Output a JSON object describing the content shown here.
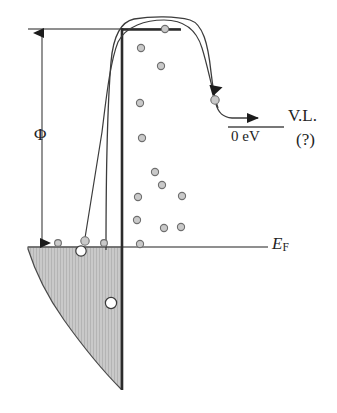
{
  "figure": {
    "type": "energy-level-diagram",
    "title_text": "",
    "colors": {
      "line": "#2b2b2b",
      "thin_line": "#555555",
      "band_fill": "#c8c8c8",
      "band_hatch": "#b0b0b0",
      "band_edge": "#4a4a4a",
      "electron_fill": "#c9c9c9",
      "electron_stroke": "#6e6e6e",
      "hole_fill": "#ffffff",
      "hole_stroke": "#3a3a3a",
      "background": "#ffffff"
    },
    "labels": {
      "work_function": "Φ",
      "fermi_level": "E",
      "fermi_level_sub": "F",
      "vacuum_energy": "0 eV",
      "vacuum_level": "V.L.",
      "vacuum_level_query": "(?)"
    },
    "levels": {
      "vacuum_line_y": 29,
      "fermi_line_y": 247,
      "zero_ev_line_y": 127,
      "surface_x": 122
    },
    "electrons": [
      {
        "cx": 165,
        "cy": 29,
        "r": 3.6
      },
      {
        "cx": 141,
        "cy": 48,
        "r": 3.6
      },
      {
        "cx": 161,
        "cy": 66,
        "r": 3.6
      },
      {
        "cx": 140,
        "cy": 103,
        "r": 3.6
      },
      {
        "cx": 142,
        "cy": 138,
        "r": 3.6
      },
      {
        "cx": 155,
        "cy": 172,
        "r": 3.6
      },
      {
        "cx": 162,
        "cy": 185,
        "r": 3.6
      },
      {
        "cx": 138,
        "cy": 197,
        "r": 3.6
      },
      {
        "cx": 182,
        "cy": 196,
        "r": 3.6
      },
      {
        "cx": 137,
        "cy": 220,
        "r": 3.6
      },
      {
        "cx": 181,
        "cy": 227,
        "r": 3.6
      },
      {
        "cx": 164,
        "cy": 228,
        "r": 3.6
      },
      {
        "cx": 140,
        "cy": 244,
        "r": 3.6
      },
      {
        "cx": 58,
        "cy": 243,
        "r": 3.4
      },
      {
        "cx": 104,
        "cy": 243,
        "r": 3.4
      },
      {
        "cx": 85,
        "cy": 241,
        "r": 4.2
      },
      {
        "cx": 215,
        "cy": 100,
        "r": 4.2
      }
    ],
    "holes": [
      {
        "cx": 81,
        "cy": 251,
        "r": 5.2
      },
      {
        "cx": 111,
        "cy": 303,
        "r": 5.6
      }
    ],
    "annotations": {
      "phi_arrow": "double-headed vertical arrow from vacuum level to Fermi level",
      "trajectory": "electron emission path over surface barrier",
      "barrier": "image-potential rounded barrier above surface"
    }
  }
}
